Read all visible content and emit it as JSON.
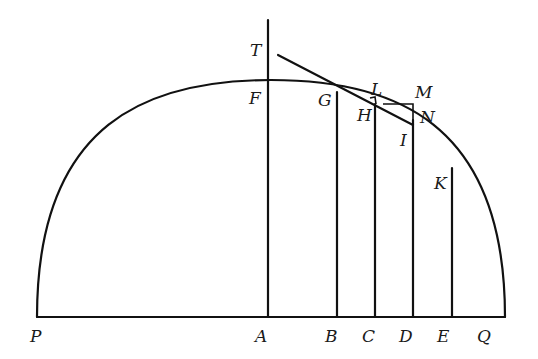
{
  "diagram": {
    "type": "geometric-construction",
    "labels": {
      "P": "P",
      "A": "A",
      "B": "B",
      "C": "C",
      "D": "D",
      "E": "E",
      "Q": "Q",
      "T": "T",
      "F": "F",
      "G": "G",
      "H": "H",
      "L": "L",
      "M": "M",
      "N": "N",
      "I": "I",
      "K": "K"
    },
    "points": {
      "P": [
        37,
        317
      ],
      "A": [
        269,
        317
      ],
      "B": [
        336,
        317
      ],
      "C": [
        374,
        317
      ],
      "D": [
        413,
        317
      ],
      "E": [
        452,
        317
      ],
      "Q": [
        505,
        317
      ],
      "F": [
        269,
        80
      ],
      "G": [
        337,
        92
      ],
      "H": [
        375,
        104
      ],
      "I": [
        413,
        126
      ],
      "K": [
        452,
        168
      ],
      "T": [
        271,
        55
      ],
      "L": [
        375,
        97
      ],
      "M": [
        413,
        102
      ],
      "N": [
        413,
        110
      ]
    },
    "colors": {
      "ink": "#111111",
      "background": "#ffffff"
    }
  }
}
